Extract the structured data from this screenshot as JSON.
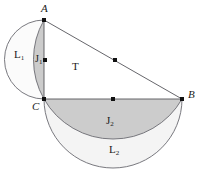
{
  "figure": {
    "kind": "geometry-diagram",
    "background": "#ffffff",
    "stroke_color": "#55555a",
    "point_color": "#1a1a1a",
    "fill_lune_dark": "#c9c9c9",
    "fill_lune_light": "#e6e6e6",
    "canvas": {
      "width": 203,
      "height": 183
    }
  },
  "vertices": [
    {
      "id": "A",
      "label": "A",
      "x": 44,
      "y": 20,
      "label_x": 41,
      "label_y": 4,
      "italic": true
    },
    {
      "id": "B",
      "label": "B",
      "x": 182,
      "y": 99,
      "label_x": 188,
      "label_y": 90,
      "italic": true
    },
    {
      "id": "C",
      "label": "C",
      "x": 44,
      "y": 99,
      "label_x": 33,
      "label_y": 101,
      "italic": true
    }
  ],
  "midpoints": [
    {
      "id": "M_AB",
      "x": 115,
      "y": 60
    },
    {
      "id": "M_CB",
      "x": 113,
      "y": 99
    },
    {
      "id": "M_AC_arc",
      "x": 45,
      "y": 60
    }
  ],
  "region_labels": [
    {
      "id": "L1",
      "base": "L",
      "sub": "1",
      "x": 16,
      "y": 50
    },
    {
      "id": "J1",
      "base": "J",
      "sub": "1",
      "x": 36,
      "y": 54
    },
    {
      "id": "T",
      "base": "T",
      "sub": "",
      "x": 73,
      "y": 62
    },
    {
      "id": "J2",
      "base": "J",
      "sub": "2",
      "x": 107,
      "y": 115
    },
    {
      "id": "L2",
      "base": "L",
      "sub": "2",
      "x": 110,
      "y": 144
    }
  ],
  "segments": [
    {
      "id": "AB",
      "from": "A",
      "to": "B"
    },
    {
      "id": "CB",
      "from": "C",
      "to": "B"
    },
    {
      "id": "AC",
      "from": "A",
      "to": "C"
    }
  ],
  "arcs": [
    {
      "id": "semicircle-AC-left",
      "note": "semicircle on diameter AC bulging left"
    },
    {
      "id": "lune-J1-arc",
      "note": "arc of circumcircle of triangle through A and C"
    },
    {
      "id": "semicircle-CB-below",
      "note": "semicircle on diameter CB bulging down"
    },
    {
      "id": "lune-J2-arc",
      "note": "arc of circumcircle of triangle through C and B"
    }
  ]
}
